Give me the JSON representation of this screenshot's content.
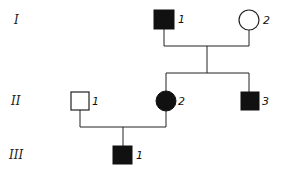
{
  "diagram": {
    "type": "pedigree",
    "generations": [
      {
        "label": "I",
        "y": 20
      },
      {
        "label": "II",
        "y": 101
      },
      {
        "label": "III",
        "y": 155
      }
    ],
    "individuals": [
      {
        "id": "I-1",
        "label": "1",
        "sex": "male",
        "affected": true
      },
      {
        "id": "I-2",
        "label": "2",
        "sex": "female",
        "affected": false
      },
      {
        "id": "II-1",
        "label": "1",
        "sex": "male",
        "affected": false
      },
      {
        "id": "II-2",
        "label": "2",
        "sex": "female",
        "affected": true
      },
      {
        "id": "II-3",
        "label": "3",
        "sex": "male",
        "affected": true
      },
      {
        "id": "III-1",
        "label": "1",
        "sex": "male",
        "affected": true
      }
    ],
    "colors": {
      "affected": "#111111",
      "unaffected": "#ffffff",
      "line": "#222222"
    }
  }
}
